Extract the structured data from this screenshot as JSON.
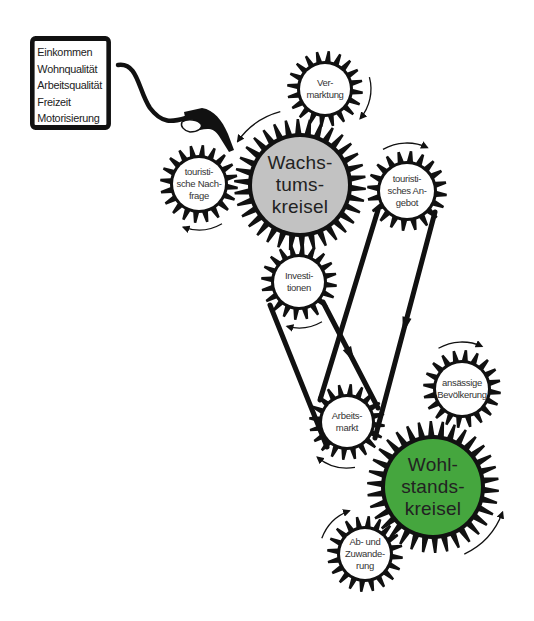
{
  "info_box": {
    "lines": [
      "Einkommen",
      "Wohnqualität",
      "Arbeitsqualität",
      "Freizeit",
      "Motorisierung"
    ]
  },
  "colors": {
    "ink": "#111111",
    "wachstum_fill": "#c2c2c2",
    "wohlstand_fill": "#45a63e",
    "small_fill": "#ffffff",
    "background": "#ffffff"
  },
  "gears": [
    {
      "id": "vermarktung",
      "lines": [
        "Ver-",
        "marktung"
      ],
      "cx": 325,
      "cy": 89,
      "r_in": 28,
      "r_out": 38,
      "teeth": 20,
      "size": "small",
      "fill": "small_fill"
    },
    {
      "id": "wachstumskreisel",
      "lines": [
        "Wachs-",
        "tums-",
        "kreisel"
      ],
      "cx": 300,
      "cy": 185,
      "r_in": 52,
      "r_out": 66,
      "teeth": 34,
      "size": "big",
      "fill": "wachstum_fill"
    },
    {
      "id": "touristische-nachfrage",
      "lines": [
        "touristi-",
        "sche Nach-",
        "frage"
      ],
      "cx": 199,
      "cy": 184,
      "r_in": 29,
      "r_out": 39,
      "teeth": 20,
      "size": "small",
      "fill": "small_fill"
    },
    {
      "id": "touristisches-angebot",
      "lines": [
        "touristi-",
        "sches An-",
        "gebot"
      ],
      "cx": 407,
      "cy": 191,
      "r_in": 30,
      "r_out": 40,
      "teeth": 20,
      "size": "small",
      "fill": "small_fill"
    },
    {
      "id": "investitionen",
      "lines": [
        "Investi-",
        "tionen"
      ],
      "cx": 299,
      "cy": 282,
      "r_in": 28,
      "r_out": 38,
      "teeth": 20,
      "size": "small",
      "fill": "small_fill"
    },
    {
      "id": "arbeitsmarkt",
      "lines": [
        "Arbeits-",
        "markt"
      ],
      "cx": 347,
      "cy": 422,
      "r_in": 28,
      "r_out": 38,
      "teeth": 20,
      "size": "small",
      "fill": "small_fill"
    },
    {
      "id": "ansaessige-bevoelkerung",
      "lines": [
        "ansässige",
        "Bevölkerung"
      ],
      "cx": 462,
      "cy": 389,
      "r_in": 29,
      "r_out": 39,
      "teeth": 20,
      "size": "small",
      "fill": "small_fill"
    },
    {
      "id": "wohlstandskreisel",
      "lines": [
        "Wohl-",
        "stands-",
        "kreisel"
      ],
      "cx": 433,
      "cy": 487,
      "r_in": 52,
      "r_out": 66,
      "teeth": 34,
      "size": "big",
      "fill": "wohlstand_fill"
    },
    {
      "id": "ab-und-zuwanderung",
      "lines": [
        "Ab- und",
        "Zuwande-",
        "rung"
      ],
      "cx": 365,
      "cy": 554,
      "r_in": 28,
      "r_out": 38,
      "teeth": 20,
      "size": "small",
      "fill": "small_fill"
    }
  ],
  "belts": [
    {
      "from": "investitionen",
      "to": "arbeitsmarkt",
      "type": "crossed"
    },
    {
      "from": "touristisches-angebot",
      "to": "arbeitsmarkt",
      "type": "open"
    }
  ],
  "rotation_arrows": [
    {
      "gear": "vermarktung",
      "start_deg": -15,
      "end_deg": 40,
      "r": 46
    },
    {
      "gear": "wachstumskreisel",
      "start_deg": 255,
      "end_deg": 215,
      "r": 76
    },
    {
      "gear": "touristische-nachfrage",
      "start_deg": 60,
      "end_deg": 110,
      "r": 46
    },
    {
      "gear": "touristisches-angebot",
      "start_deg": 240,
      "end_deg": 295,
      "r": 48
    },
    {
      "gear": "investitionen",
      "start_deg": 60,
      "end_deg": 105,
      "r": 46
    },
    {
      "gear": "arbeitsmarkt",
      "start_deg": 80,
      "end_deg": 130,
      "r": 46
    },
    {
      "gear": "ansaessige-bevoelkerung",
      "start_deg": 240,
      "end_deg": 295,
      "r": 47
    },
    {
      "gear": "wohlstandskreisel",
      "start_deg": 65,
      "end_deg": 20,
      "r": 74
    },
    {
      "gear": "ab-und-zuwanderung",
      "start_deg": 200,
      "end_deg": 250,
      "r": 46
    }
  ]
}
